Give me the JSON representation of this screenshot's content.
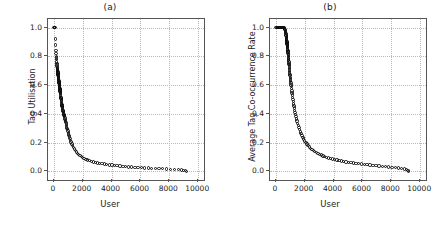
{
  "figure": {
    "xlabel": "User",
    "panels": [
      {
        "title": "(a)",
        "ylabel": "Tag Utilisation"
      },
      {
        "title": "(b)",
        "ylabel": "Average Tag Co-occurrence Rate"
      }
    ]
  },
  "axis": {
    "xticks": [
      "0",
      "2000",
      "4000",
      "6000",
      "8000",
      "10000"
    ],
    "xtick_values": [
      0,
      2000,
      4000,
      6000,
      8000,
      10000
    ],
    "yticks": [
      "0.0",
      "0.2",
      "0.4",
      "0.6",
      "0.8",
      "1.0"
    ],
    "ytick_values": [
      0.0,
      0.2,
      0.4,
      0.6,
      0.8,
      1.0
    ]
  },
  "style": {
    "marker_color": "#0d0d0d",
    "grid_color": "#b9b9b9",
    "frame_color": "#555555",
    "background": "#ffffff",
    "marker": "open-circle"
  },
  "chart_data": [
    {
      "type": "scatter",
      "title": "(a)",
      "xlabel": "User",
      "ylabel": "Tag Utilisation",
      "xlim": [
        -400,
        10400
      ],
      "ylim": [
        -0.06,
        1.06
      ],
      "grid": true,
      "legend": null,
      "marker": "open-circle",
      "x": [
        20,
        45,
        70,
        95,
        115,
        135,
        150,
        160,
        170,
        180,
        190,
        200,
        210,
        220,
        230,
        240,
        248,
        255,
        262,
        268,
        275,
        282,
        288,
        294,
        300,
        306,
        312,
        318,
        324,
        330,
        336,
        342,
        348,
        354,
        360,
        366,
        372,
        378,
        384,
        390,
        396,
        402,
        408,
        414,
        420,
        426,
        432,
        438,
        444,
        450,
        458,
        466,
        474,
        482,
        490,
        498,
        506,
        514,
        522,
        530,
        540,
        550,
        560,
        570,
        580,
        590,
        600,
        612,
        624,
        636,
        648,
        660,
        675,
        690,
        705,
        720,
        735,
        750,
        768,
        786,
        804,
        822,
        840,
        860,
        880,
        900,
        925,
        950,
        975,
        1000,
        1030,
        1060,
        1090,
        1120,
        1160,
        1200,
        1250,
        1300,
        1360,
        1420,
        1490,
        1560,
        1640,
        1720,
        1810,
        1900,
        2000,
        2100,
        2220,
        2340,
        2470,
        2600,
        2740,
        2880,
        3030,
        3180,
        3340,
        3500,
        3670,
        3840,
        4020,
        4200,
        4390,
        4580,
        4780,
        4980,
        5190,
        5400,
        5620,
        5840,
        6070,
        6300,
        6540,
        6780,
        7030,
        7280,
        7540,
        7800,
        8070,
        8340,
        8620,
        8850,
        9000,
        9100,
        9180
      ],
      "y": [
        1.0,
        1.0,
        1.0,
        1.0,
        0.92,
        0.88,
        0.84,
        0.82,
        0.8,
        0.79,
        0.78,
        0.76,
        0.75,
        0.74,
        0.73,
        0.72,
        0.715,
        0.71,
        0.705,
        0.7,
        0.695,
        0.69,
        0.685,
        0.68,
        0.675,
        0.67,
        0.665,
        0.66,
        0.655,
        0.65,
        0.645,
        0.64,
        0.635,
        0.63,
        0.625,
        0.62,
        0.615,
        0.61,
        0.605,
        0.6,
        0.595,
        0.59,
        0.585,
        0.58,
        0.575,
        0.57,
        0.565,
        0.56,
        0.555,
        0.55,
        0.545,
        0.54,
        0.53,
        0.52,
        0.515,
        0.51,
        0.505,
        0.5,
        0.495,
        0.49,
        0.48,
        0.47,
        0.465,
        0.46,
        0.455,
        0.45,
        0.445,
        0.44,
        0.43,
        0.425,
        0.42,
        0.415,
        0.41,
        0.4,
        0.395,
        0.39,
        0.385,
        0.38,
        0.37,
        0.36,
        0.355,
        0.345,
        0.34,
        0.33,
        0.32,
        0.31,
        0.3,
        0.29,
        0.28,
        0.27,
        0.26,
        0.25,
        0.24,
        0.23,
        0.215,
        0.205,
        0.19,
        0.18,
        0.165,
        0.155,
        0.145,
        0.135,
        0.125,
        0.118,
        0.11,
        0.103,
        0.096,
        0.09,
        0.084,
        0.079,
        0.074,
        0.07,
        0.066,
        0.062,
        0.059,
        0.056,
        0.053,
        0.05,
        0.047,
        0.045,
        0.043,
        0.041,
        0.039,
        0.037,
        0.035,
        0.033,
        0.031,
        0.03,
        0.028,
        0.027,
        0.025,
        0.024,
        0.023,
        0.021,
        0.02,
        0.019,
        0.018,
        0.016,
        0.015,
        0.014,
        0.012,
        0.01,
        0.008,
        0.005,
        0.0
      ]
    },
    {
      "type": "scatter",
      "title": "(b)",
      "xlabel": "User",
      "ylabel": "Average Tag Co-occurrence Rate",
      "xlim": [
        -400,
        10400
      ],
      "ylim": [
        -0.06,
        1.06
      ],
      "grid": true,
      "legend": null,
      "marker": "open-circle",
      "x": [
        20,
        60,
        100,
        140,
        180,
        220,
        260,
        300,
        340,
        380,
        420,
        455,
        490,
        520,
        550,
        575,
        600,
        620,
        640,
        655,
        668,
        680,
        690,
        700,
        708,
        715,
        722,
        728,
        734,
        740,
        746,
        752,
        758,
        764,
        770,
        776,
        782,
        788,
        794,
        800,
        806,
        812,
        818,
        824,
        830,
        836,
        842,
        848,
        854,
        860,
        867,
        874,
        881,
        888,
        895,
        902,
        909,
        916,
        923,
        930,
        938,
        946,
        954,
        962,
        970,
        980,
        990,
        1000,
        1012,
        1024,
        1036,
        1050,
        1064,
        1078,
        1094,
        1110,
        1128,
        1146,
        1166,
        1186,
        1208,
        1230,
        1254,
        1280,
        1308,
        1336,
        1368,
        1400,
        1436,
        1472,
        1512,
        1554,
        1600,
        1648,
        1700,
        1754,
        1812,
        1872,
        1938,
        2006,
        2080,
        2156,
        2238,
        2322,
        2412,
        2504,
        2602,
        2702,
        2808,
        2916,
        3030,
        3146,
        3268,
        3392,
        3522,
        3654,
        3792,
        3932,
        4078,
        4226,
        4380,
        4536,
        4698,
        4862,
        5032,
        5204,
        5382,
        5562,
        5748,
        5936,
        6130,
        6326,
        6528,
        6732,
        6942,
        7154,
        7372,
        7592,
        7818,
        8046,
        8280,
        8516,
        8720,
        8900,
        9050,
        9150,
        9200
      ],
      "y": [
        1.0,
        1.0,
        1.0,
        1.0,
        1.0,
        1.0,
        1.0,
        1.0,
        1.0,
        1.0,
        1.0,
        1.0,
        1.0,
        1.0,
        1.0,
        1.0,
        0.995,
        0.99,
        0.985,
        0.98,
        0.975,
        0.97,
        0.965,
        0.96,
        0.95,
        0.945,
        0.94,
        0.935,
        0.93,
        0.925,
        0.92,
        0.915,
        0.91,
        0.905,
        0.9,
        0.895,
        0.89,
        0.885,
        0.88,
        0.875,
        0.87,
        0.865,
        0.86,
        0.85,
        0.845,
        0.84,
        0.835,
        0.83,
        0.82,
        0.815,
        0.81,
        0.8,
        0.79,
        0.785,
        0.775,
        0.77,
        0.76,
        0.75,
        0.745,
        0.735,
        0.725,
        0.715,
        0.705,
        0.695,
        0.685,
        0.675,
        0.665,
        0.655,
        0.645,
        0.635,
        0.625,
        0.615,
        0.6,
        0.59,
        0.575,
        0.56,
        0.545,
        0.53,
        0.515,
        0.5,
        0.485,
        0.47,
        0.455,
        0.44,
        0.425,
        0.41,
        0.395,
        0.38,
        0.365,
        0.35,
        0.335,
        0.32,
        0.305,
        0.29,
        0.275,
        0.262,
        0.248,
        0.236,
        0.224,
        0.212,
        0.2,
        0.19,
        0.18,
        0.17,
        0.161,
        0.153,
        0.145,
        0.138,
        0.131,
        0.125,
        0.119,
        0.113,
        0.108,
        0.103,
        0.098,
        0.094,
        0.09,
        0.086,
        0.082,
        0.078,
        0.075,
        0.072,
        0.069,
        0.066,
        0.063,
        0.06,
        0.058,
        0.055,
        0.053,
        0.05,
        0.048,
        0.046,
        0.044,
        0.042,
        0.04,
        0.037,
        0.035,
        0.033,
        0.031,
        0.029,
        0.026,
        0.023,
        0.02,
        0.016,
        0.011,
        0.005,
        0.0
      ]
    }
  ]
}
